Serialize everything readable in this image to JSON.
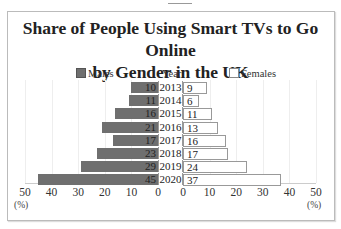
{
  "chart_data": {
    "type": "bar",
    "subtype": "population-pyramid (horizontal diverging bar)",
    "title": "Share of People Using Smart TVs to Go Online by Gender in the UK",
    "categories": [
      "2013",
      "2014",
      "2015",
      "2016",
      "2017",
      "2018",
      "2019",
      "2020"
    ],
    "category_label": "Year",
    "series": [
      {
        "name": "Males",
        "values": [
          10,
          11,
          16,
          21,
          17,
          23,
          29,
          45
        ],
        "color": "#6f6f6f",
        "side": "left"
      },
      {
        "name": "Females",
        "values": [
          9,
          6,
          11,
          13,
          16,
          17,
          24,
          37
        ],
        "color": "#ffffff",
        "side": "right"
      }
    ],
    "xlabel_left": "(%)",
    "xlabel_right": "(%)",
    "xticks_left": [
      "50",
      "40",
      "30",
      "20",
      "10",
      "0"
    ],
    "xticks_right": [
      "0",
      "10",
      "20",
      "30",
      "40",
      "50"
    ],
    "xlim": [
      0,
      50
    ],
    "grid": true,
    "legend_position": "top"
  },
  "title_line1": "Share of People Using Smart TVs to Go Online",
  "title_line2": "by Gender in the UK",
  "legend": {
    "males": "Males",
    "year": "Year",
    "females": "Females"
  },
  "axis": {
    "unit": "(%)"
  }
}
